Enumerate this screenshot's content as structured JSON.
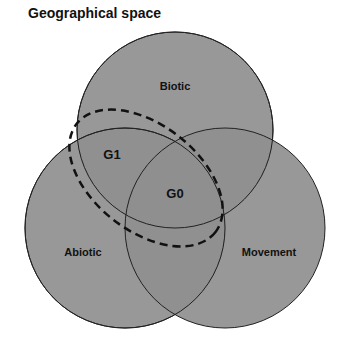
{
  "title": "Geographical space",
  "colors": {
    "circle_fill": "#8f8f8f",
    "circle_stroke": "#222222",
    "dashed_stroke": "#111111",
    "background": "#ffffff"
  },
  "circles": [
    {
      "name": "Biotic",
      "label": "Biotic",
      "cx": 175,
      "cy": 130,
      "r": 98,
      "label_x": 175,
      "label_y": 90
    },
    {
      "name": "Abiotic",
      "label": "Abiotic",
      "cx": 125,
      "cy": 228,
      "r": 100,
      "label_x": 83,
      "label_y": 256
    },
    {
      "name": "Movement",
      "label": "Movement",
      "cx": 225,
      "cy": 228,
      "r": 100,
      "label_x": 269,
      "label_y": 256
    }
  ],
  "regions": {
    "g1": {
      "label": "G1",
      "x": 112,
      "y": 159
    },
    "g0": {
      "label": "G0",
      "x": 175,
      "y": 198
    }
  },
  "dashed_region": {
    "cx": 146,
    "cy": 178,
    "rx": 88,
    "ry": 53,
    "rotate": 38
  }
}
